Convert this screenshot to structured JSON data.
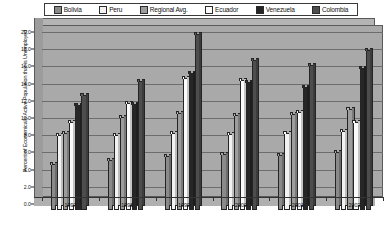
{
  "chart_data": {
    "type": "bar",
    "title": "",
    "subtitle": "",
    "xlabel": "",
    "ylabel": "Percent of Economically Active Population that is Unemployed",
    "categories": [
      "1997",
      "1998",
      "1999",
      "2000",
      "2001",
      "2002"
    ],
    "ylim": [
      0.0,
      20.0
    ],
    "ytick_step": 2.0,
    "yticks": [
      "0.0",
      "2.0",
      "4.0",
      "6.0",
      "8.0",
      "10.0",
      "12.0",
      "14.0",
      "16.0",
      "18.0",
      "20.0"
    ],
    "grid": true,
    "legend_position": "top",
    "style": "3d-clustered-column-grayscale",
    "series": [
      {
        "name": "Bolivia",
        "color": "#8a8a8a",
        "values": [
          4.4,
          4.8,
          5.3,
          5.5,
          5.4,
          5.7
        ]
      },
      {
        "name": "Peru",
        "color": "#f2f2f2",
        "values": [
          7.7,
          7.7,
          7.9,
          7.8,
          7.9,
          8.2
        ]
      },
      {
        "name": "Regional Avg.",
        "color": "#9d9d9d",
        "values": [
          8.0,
          9.8,
          10.3,
          10.1,
          10.2,
          10.8
        ]
      },
      {
        "name": "Ecuador",
        "color": "#fbfbfb",
        "values": [
          9.2,
          11.4,
          14.4,
          14.1,
          10.4,
          9.2
        ]
      },
      {
        "name": "Venezuela",
        "color": "#262626",
        "values": [
          11.2,
          11.3,
          14.9,
          13.9,
          13.3,
          15.5
        ]
      },
      {
        "name": "Colombia",
        "color": "#4d4d4d",
        "values": [
          12.4,
          14.0,
          19.5,
          16.4,
          15.9,
          17.6
        ]
      }
    ]
  },
  "legend": {
    "items": [
      {
        "label": "Bolivia",
        "color": "#8a8a8a"
      },
      {
        "label": "Peru",
        "color": "#f2f2f2"
      },
      {
        "label": "Regional Avg.",
        "color": "#9d9d9d"
      },
      {
        "label": "Ecuador",
        "color": "#fbfbfb"
      },
      {
        "label": "Venezuela",
        "color": "#262626"
      },
      {
        "label": "Colombia",
        "color": "#4d4d4d"
      }
    ]
  },
  "axes": {
    "y_title": "Percent of Economically Active Population that is Unemployed",
    "y_labels": [
      "20.0",
      "18.0",
      "16.0",
      "14.0",
      "12.0",
      "10.0",
      "8.0",
      "6.0",
      "4.0",
      "2.0",
      "0.0"
    ],
    "x_labels": [
      "1997",
      "1998",
      "1999",
      "2000",
      "2001",
      "2002"
    ]
  }
}
